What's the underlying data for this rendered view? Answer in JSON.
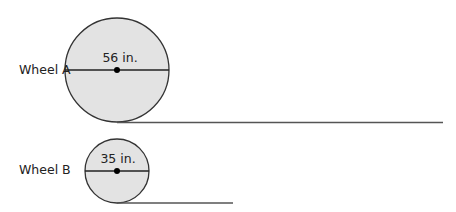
{
  "wheels": [
    {
      "name": "Wheel A",
      "diameter_label": "56 in.",
      "cx": 117,
      "cy": 70,
      "r": 52,
      "line_end": 443
    },
    {
      "name": "Wheel B",
      "diameter_label": "35 in.",
      "cx": 117,
      "cy": 171,
      "r": 32,
      "line_end": 233
    }
  ],
  "colors": {
    "fill": "#e3e3e3",
    "stroke": "#333333",
    "ground": "#555555"
  }
}
